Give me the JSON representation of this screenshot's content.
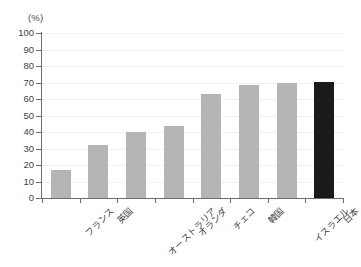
{
  "chart_data": {
    "type": "bar",
    "title": "",
    "subtitle": "",
    "xlabel": "",
    "ylabel": "",
    "unit_label": "(%)",
    "categories": [
      "フランス",
      "英国",
      "オーストラリア",
      "オランダ",
      "チェコ",
      "韓国",
      "イスラエル",
      "日本"
    ],
    "values": [
      17,
      32,
      40,
      43.5,
      63,
      68.5,
      70,
      70.5
    ],
    "ylim": [
      0,
      100
    ],
    "ytick_labels": [
      "100",
      "90",
      "80",
      "70",
      "60",
      "50",
      "40",
      "30",
      "20",
      "10",
      "0"
    ],
    "ytick_values": [
      100,
      90,
      80,
      70,
      60,
      50,
      40,
      30,
      20,
      10,
      0
    ],
    "ytick_step": 10,
    "grid": true,
    "grid_axis": "y",
    "legend": false,
    "legend_position": "none",
    "bar_color": "#b5b5b5",
    "highlight_bar_color": "#1a1a1a",
    "highlight_category": "日本",
    "axis_color": "#6e6e6e",
    "gridline_color": "#f0f0f0",
    "background_color": "#ffffff",
    "label_rotation_deg": -45,
    "annotations": []
  }
}
